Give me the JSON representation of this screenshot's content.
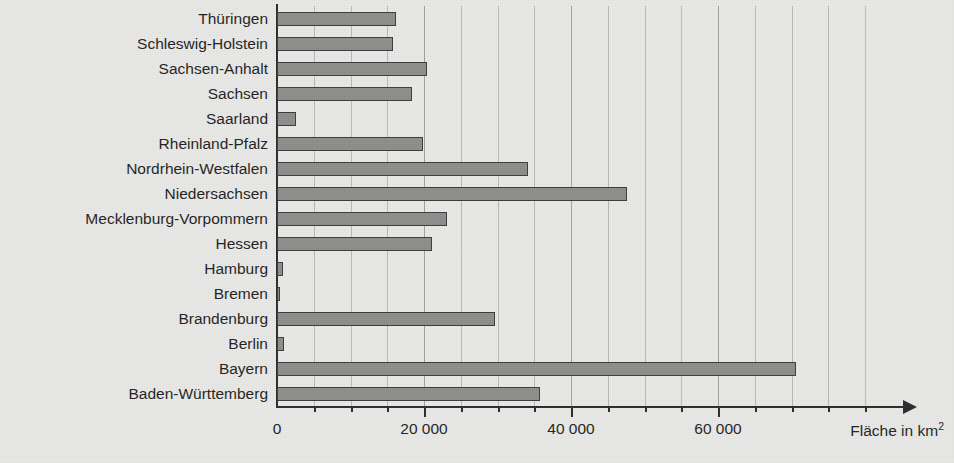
{
  "chart_data": {
    "type": "bar",
    "orientation": "horizontal",
    "title": "",
    "xlabel": "Fläche in km2",
    "xlabel_display": "Fläche in km",
    "xlabel_exponent": "2",
    "ylabel": "",
    "xlim": [
      0,
      85000
    ],
    "xticks": [
      0,
      20000,
      40000,
      60000
    ],
    "xticklabels": [
      "0",
      "20 000",
      "40 000",
      "60 000"
    ],
    "minor_gridline_step": 5000,
    "grid": true,
    "legend": false,
    "bar_fill_color": "#8d8d8c",
    "bar_border_color": "#3b3b3b",
    "background_color": "#e9e9e7",
    "axis_color": "#2b2b2b",
    "categories": [
      "Thüringen",
      "Schleswig-Holstein",
      "Sachsen-Anhalt",
      "Sachsen",
      "Saarland",
      "Rheinland-Pfalz",
      "Nordrhein-Westfalen",
      "Niedersachsen",
      "Mecklenburg-Vorpommern",
      "Hessen",
      "Hamburg",
      "Bremen",
      "Brandenburg",
      "Berlin",
      "Bayern",
      "Baden-Württemberg"
    ],
    "values": [
      16200,
      15800,
      20450,
      18420,
      2570,
      19850,
      34100,
      47600,
      23180,
      21120,
      760,
      420,
      29650,
      890,
      70550,
      35750
    ]
  },
  "axis": {
    "arrow_icon": "arrow-right-icon"
  }
}
